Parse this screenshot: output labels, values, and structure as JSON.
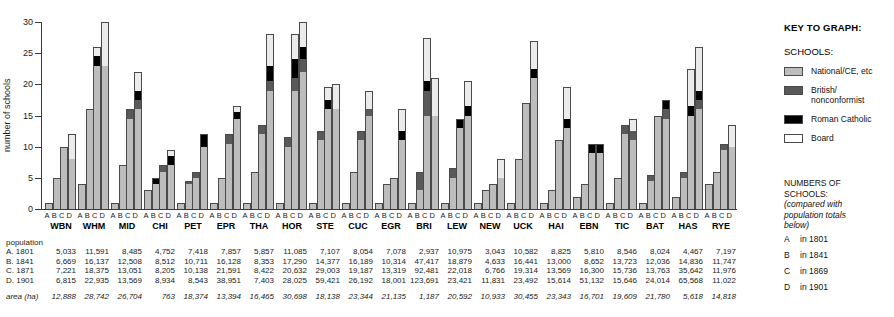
{
  "chart_data": {
    "type": "bar",
    "title": "",
    "xlabel": "",
    "ylabel": "number of schools",
    "ylim": [
      0,
      30
    ],
    "yticks": [
      0,
      5,
      10,
      15,
      20,
      25,
      30
    ],
    "grid": false,
    "legend_position": "right",
    "stacked": true,
    "series_names": [
      "National/CE, etc",
      "British/nonconformist",
      "Roman Catholic",
      "Board"
    ],
    "subcategories": [
      "A",
      "B",
      "C",
      "D"
    ],
    "categories": [
      "WBN",
      "WHM",
      "MID",
      "CHI",
      "PET",
      "EPR",
      "THA",
      "HOR",
      "STE",
      "CUC",
      "EGR",
      "BRI",
      "LEW",
      "NEW",
      "UCK",
      "HAI",
      "EBN",
      "TIC",
      "BAT",
      "HAS",
      "RYE"
    ],
    "groups": [
      {
        "name": "WBN",
        "bars": [
          {
            "key": "A",
            "national": 1,
            "british": 0,
            "catholic": 0,
            "board": 0
          },
          {
            "key": "B",
            "national": 5,
            "british": 0,
            "catholic": 0,
            "board": 0
          },
          {
            "key": "C",
            "national": 10,
            "british": 0,
            "catholic": 0,
            "board": 0
          },
          {
            "key": "D",
            "national": 8,
            "british": 0,
            "catholic": 0,
            "board": 4
          }
        ]
      },
      {
        "name": "WHM",
        "bars": [
          {
            "key": "A",
            "national": 4,
            "british": 0,
            "catholic": 0,
            "board": 0
          },
          {
            "key": "B",
            "national": 16,
            "british": 0,
            "catholic": 0,
            "board": 0
          },
          {
            "key": "C",
            "national": 23,
            "british": 0,
            "catholic": 1.5,
            "board": 1.5
          },
          {
            "key": "D",
            "national": 23,
            "british": 0,
            "catholic": 0,
            "board": 7
          }
        ]
      },
      {
        "name": "MID",
        "bars": [
          {
            "key": "A",
            "national": 1,
            "british": 0,
            "catholic": 0,
            "board": 0
          },
          {
            "key": "B",
            "national": 7,
            "british": 0,
            "catholic": 0,
            "board": 0
          },
          {
            "key": "C",
            "national": 14.5,
            "british": 1.5,
            "catholic": 0,
            "board": 0
          },
          {
            "key": "D",
            "national": 16,
            "british": 1.5,
            "catholic": 1.5,
            "board": 3
          }
        ]
      },
      {
        "name": "CHI",
        "bars": [
          {
            "key": "A",
            "national": 3,
            "british": 0,
            "catholic": 0,
            "board": 0
          },
          {
            "key": "B",
            "national": 4,
            "british": 0,
            "catholic": 1,
            "board": 0
          },
          {
            "key": "C",
            "national": 6,
            "british": 1,
            "catholic": 0,
            "board": 0
          },
          {
            "key": "D",
            "national": 7,
            "british": 0,
            "catholic": 1.5,
            "board": 1
          }
        ]
      },
      {
        "name": "PET",
        "bars": [
          {
            "key": "A",
            "national": 1,
            "british": 0,
            "catholic": 0,
            "board": 0
          },
          {
            "key": "B",
            "national": 4,
            "british": 0.5,
            "catholic": 0,
            "board": 0
          },
          {
            "key": "C",
            "national": 5,
            "british": 1,
            "catholic": 0,
            "board": 0
          },
          {
            "key": "D",
            "national": 10,
            "british": 0,
            "catholic": 2,
            "board": 0
          }
        ]
      },
      {
        "name": "EPR",
        "bars": [
          {
            "key": "A",
            "national": 1,
            "british": 0,
            "catholic": 0,
            "board": 0
          },
          {
            "key": "B",
            "national": 5,
            "british": 0,
            "catholic": 0,
            "board": 0
          },
          {
            "key": "C",
            "national": 10.5,
            "british": 1.5,
            "catholic": 0,
            "board": 0
          },
          {
            "key": "D",
            "national": 14.5,
            "british": 0,
            "catholic": 1,
            "board": 1
          }
        ]
      },
      {
        "name": "THA",
        "bars": [
          {
            "key": "A",
            "national": 1,
            "british": 0,
            "catholic": 0,
            "board": 0
          },
          {
            "key": "B",
            "national": 6,
            "british": 0,
            "catholic": 0,
            "board": 0
          },
          {
            "key": "C",
            "national": 12,
            "british": 1.5,
            "catholic": 0,
            "board": 0
          },
          {
            "key": "D",
            "national": 19,
            "british": 1.5,
            "catholic": 2.5,
            "board": 5
          }
        ]
      },
      {
        "name": "HOR",
        "bars": [
          {
            "key": "A",
            "national": 1,
            "british": 0,
            "catholic": 0,
            "board": 0
          },
          {
            "key": "B",
            "national": 10,
            "british": 1.5,
            "catholic": 0,
            "board": 0
          },
          {
            "key": "C",
            "national": 19,
            "british": 2,
            "catholic": 3,
            "board": 4
          },
          {
            "key": "D",
            "national": 22,
            "british": 2,
            "catholic": 2,
            "board": 4
          }
        ]
      },
      {
        "name": "STE",
        "bars": [
          {
            "key": "A",
            "national": 1,
            "british": 0,
            "catholic": 0,
            "board": 0
          },
          {
            "key": "B",
            "national": 11,
            "british": 1.5,
            "catholic": 0,
            "board": 0
          },
          {
            "key": "C",
            "national": 16,
            "british": 0,
            "catholic": 1.5,
            "board": 2
          },
          {
            "key": "D",
            "national": 16,
            "british": 0,
            "catholic": 0,
            "board": 4
          }
        ]
      },
      {
        "name": "CUC",
        "bars": [
          {
            "key": "A",
            "national": 1,
            "british": 0,
            "catholic": 0,
            "board": 0
          },
          {
            "key": "B",
            "national": 6,
            "british": 0,
            "catholic": 0,
            "board": 0
          },
          {
            "key": "C",
            "national": 11,
            "british": 1.5,
            "catholic": 0,
            "board": 0
          },
          {
            "key": "D",
            "national": 15,
            "british": 1,
            "catholic": 0,
            "board": 3
          }
        ]
      },
      {
        "name": "EGR",
        "bars": [
          {
            "key": "A",
            "national": 1,
            "british": 0,
            "catholic": 0,
            "board": 0
          },
          {
            "key": "B",
            "national": 4,
            "british": 0,
            "catholic": 0,
            "board": 0
          },
          {
            "key": "C",
            "national": 5,
            "british": 0,
            "catholic": 0,
            "board": 0
          },
          {
            "key": "D",
            "national": 11,
            "british": 0,
            "catholic": 1.5,
            "board": 3.5
          }
        ]
      },
      {
        "name": "BRI",
        "bars": [
          {
            "key": "A",
            "national": 1,
            "british": 0,
            "catholic": 0,
            "board": 0
          },
          {
            "key": "B",
            "national": 3,
            "british": 3,
            "catholic": 0,
            "board": 0
          },
          {
            "key": "C",
            "national": 15,
            "british": 4,
            "catholic": 1.5,
            "board": 7
          },
          {
            "key": "D",
            "national": 15,
            "british": 0,
            "catholic": 0,
            "board": 6
          }
        ]
      },
      {
        "name": "LEW",
        "bars": [
          {
            "key": "A",
            "national": 1,
            "british": 0,
            "catholic": 0,
            "board": 0
          },
          {
            "key": "B",
            "national": 5,
            "british": 1.5,
            "catholic": 0,
            "board": 0
          },
          {
            "key": "C",
            "national": 13,
            "british": 0,
            "catholic": 1.5,
            "board": 0
          },
          {
            "key": "D",
            "national": 15,
            "british": 0,
            "catholic": 1.5,
            "board": 4
          }
        ]
      },
      {
        "name": "NEW",
        "bars": [
          {
            "key": "A",
            "national": 1,
            "british": 0,
            "catholic": 0,
            "board": 0
          },
          {
            "key": "B",
            "national": 3,
            "british": 0,
            "catholic": 0,
            "board": 0
          },
          {
            "key": "C",
            "national": 4,
            "british": 0,
            "catholic": 0,
            "board": 0
          },
          {
            "key": "D",
            "national": 5,
            "british": 0,
            "catholic": 0,
            "board": 3
          }
        ]
      },
      {
        "name": "UCK",
        "bars": [
          {
            "key": "A",
            "national": 1,
            "british": 0,
            "catholic": 0,
            "board": 0
          },
          {
            "key": "B",
            "national": 8,
            "british": 0,
            "catholic": 0,
            "board": 0
          },
          {
            "key": "C",
            "national": 17,
            "british": 0,
            "catholic": 0,
            "board": 0
          },
          {
            "key": "D",
            "national": 21,
            "british": 0,
            "catholic": 1.5,
            "board": 4.5
          }
        ]
      },
      {
        "name": "HAI",
        "bars": [
          {
            "key": "A",
            "national": 1,
            "british": 0,
            "catholic": 0,
            "board": 0
          },
          {
            "key": "B",
            "national": 3,
            "british": 0,
            "catholic": 0,
            "board": 0
          },
          {
            "key": "C",
            "national": 11,
            "british": 0,
            "catholic": 0,
            "board": 0
          },
          {
            "key": "D",
            "national": 13,
            "british": 0,
            "catholic": 1.5,
            "board": 5
          }
        ]
      },
      {
        "name": "EBN",
        "bars": [
          {
            "key": "A",
            "national": 2,
            "british": 0,
            "catholic": 0,
            "board": 0
          },
          {
            "key": "B",
            "national": 4,
            "british": 0,
            "catholic": 0,
            "board": 0
          },
          {
            "key": "C",
            "national": 9,
            "british": 0,
            "catholic": 1.5,
            "board": 0
          },
          {
            "key": "D",
            "national": 9,
            "british": 0,
            "catholic": 1.5,
            "board": 0
          }
        ]
      },
      {
        "name": "TIC",
        "bars": [
          {
            "key": "A",
            "national": 1,
            "british": 0,
            "catholic": 0,
            "board": 0
          },
          {
            "key": "B",
            "national": 5,
            "british": 0,
            "catholic": 0,
            "board": 0
          },
          {
            "key": "C",
            "national": 12,
            "british": 1.5,
            "catholic": 0,
            "board": 0
          },
          {
            "key": "D",
            "national": 11,
            "british": 1.5,
            "catholic": 0,
            "board": 2
          }
        ]
      },
      {
        "name": "BAT",
        "bars": [
          {
            "key": "A",
            "national": 1,
            "british": 0,
            "catholic": 0,
            "board": 0
          },
          {
            "key": "B",
            "national": 4.5,
            "british": 1,
            "catholic": 0,
            "board": 0
          },
          {
            "key": "C",
            "national": 15,
            "british": 0,
            "catholic": 0,
            "board": 0
          },
          {
            "key": "D",
            "national": 14.5,
            "british": 1.5,
            "catholic": 1.5,
            "board": 0
          }
        ]
      },
      {
        "name": "HAS",
        "bars": [
          {
            "key": "A",
            "national": 2,
            "british": 0,
            "catholic": 0,
            "board": 0
          },
          {
            "key": "B",
            "national": 5,
            "british": 1,
            "catholic": 0,
            "board": 0
          },
          {
            "key": "C",
            "national": 15,
            "british": 0,
            "catholic": 1.5,
            "board": 6
          },
          {
            "key": "D",
            "national": 16,
            "british": 1.5,
            "catholic": 1.5,
            "board": 7
          }
        ]
      },
      {
        "name": "RYE",
        "bars": [
          {
            "key": "A",
            "national": 4,
            "british": 0,
            "catholic": 0,
            "board": 0
          },
          {
            "key": "B",
            "national": 6,
            "british": 0,
            "catholic": 0,
            "board": 0
          },
          {
            "key": "C",
            "national": 9.5,
            "british": 1,
            "catholic": 0,
            "board": 0
          },
          {
            "key": "D",
            "national": 10,
            "british": 0,
            "catholic": 0,
            "board": 3.5
          }
        ]
      }
    ]
  },
  "table": {
    "population_header": "population",
    "rows": [
      {
        "label": "A. 1801",
        "italic": false,
        "values": [
          "5,033",
          "11,591",
          "8,485",
          "4,752",
          "7,418",
          "7,857",
          "5,857",
          "11,085",
          "7,107",
          "8,054",
          "7,078",
          "2,937",
          "10,975",
          "3,043",
          "10,582",
          "8,825",
          "5,810",
          "8,546",
          "8,024",
          "4,467",
          "7,197"
        ]
      },
      {
        "label": "B. 1841",
        "italic": false,
        "values": [
          "6,669",
          "16,137",
          "12,508",
          "8,512",
          "10,711",
          "16,128",
          "8,353",
          "17,290",
          "14,377",
          "16,189",
          "10,314",
          "47,417",
          "18,879",
          "4,633",
          "16,441",
          "13,000",
          "8,652",
          "13,723",
          "12,036",
          "14,836",
          "11,747"
        ]
      },
      {
        "label": "C. 1871",
        "italic": false,
        "values": [
          "7,221",
          "18,375",
          "13,051",
          "8,205",
          "10,138",
          "21,591",
          "8,422",
          "20,632",
          "29,003",
          "19,187",
          "13,319",
          "92,481",
          "22,018",
          "6,766",
          "19,314",
          "13,569",
          "16,300",
          "15,736",
          "13,763",
          "35,642",
          "11,976"
        ]
      },
      {
        "label": "D. 1901",
        "italic": false,
        "values": [
          "6,815",
          "22,935",
          "13,569",
          "8,934",
          "8,543",
          "38,951",
          "7,403",
          "28,025",
          "59,421",
          "26,192",
          "18,001",
          "123,691",
          "23,421",
          "11,831",
          "23,492",
          "15,614",
          "51,132",
          "15,646",
          "24,014",
          "65,568",
          "11,022"
        ]
      }
    ],
    "area_row": {
      "label": "area (ha)",
      "italic": true,
      "values": [
        "12,888",
        "28,742",
        "26,704",
        "763",
        "18,374",
        "13,394",
        "16,465",
        "30,698",
        "18,138",
        "23,344",
        "21,135",
        "1,187",
        "20,592",
        "10,933",
        "30,455",
        "23,343",
        "16,701",
        "19,609",
        "21,780",
        "5,618",
        "14,818"
      ]
    }
  },
  "key": {
    "title": "KEY TO GRAPH:",
    "schools_label": "SCHOOLS:",
    "entries": [
      {
        "swatch": "national",
        "label": "National/CE, etc"
      },
      {
        "swatch": "british",
        "label": "British/\nnonconformist"
      },
      {
        "swatch": "catholic",
        "label": "Roman Catholic"
      },
      {
        "swatch": "board",
        "label": "Board"
      }
    ],
    "numbers_title_1": "NUMBERS OF",
    "numbers_title_2": "SCHOOLS:",
    "numbers_note_1": "(compared with",
    "numbers_note_2": "population totals",
    "numbers_note_3": "below)",
    "legend_rows": [
      {
        "key": "A",
        "text": "in 1801"
      },
      {
        "key": "B",
        "text": "in 1841"
      },
      {
        "key": "C",
        "text": "in 1869"
      },
      {
        "key": "D",
        "text": "in 1901"
      }
    ]
  },
  "colors": {
    "national": "#bdbdbd",
    "british": "#595959",
    "catholic": "#000000",
    "board": "#ebebeb",
    "axis": "#3a3a3a",
    "text": "#1a1a1a"
  }
}
